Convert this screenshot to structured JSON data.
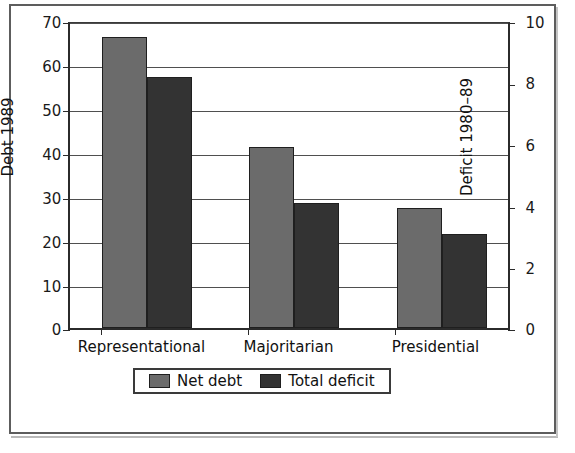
{
  "chart_data": {
    "type": "bar",
    "title": "",
    "subtitle": "",
    "categories": [
      "Representational",
      "Majoritarian",
      "Presidential"
    ],
    "series": [
      {
        "name": "Net debt",
        "axis": "left",
        "color": "#6b6b6b",
        "values": [
          66.2,
          41.2,
          27.2
        ]
      },
      {
        "name": "Total deficit",
        "axis": "right",
        "color": "#333333",
        "values": [
          8.15,
          4.05,
          3.05
        ]
      }
    ],
    "left_axis": {
      "label": "Debt 1989",
      "ticks": [
        0,
        10,
        20,
        30,
        40,
        50,
        60,
        70
      ],
      "lim": [
        0,
        70
      ]
    },
    "right_axis": {
      "label": "Deficit 1980–89",
      "ticks": [
        0,
        2,
        4,
        6,
        8,
        10
      ],
      "lim": [
        0,
        10
      ]
    },
    "xlabel": "",
    "grid": true,
    "legend_position": "bottom-center",
    "legend_entries": [
      "Net debt",
      "Total deficit"
    ],
    "bar_values_left_scale": {
      "net_debt": [
        66.2,
        41.2,
        27.2
      ],
      "total_deficit": [
        57.0,
        28.4,
        21.4
      ]
    }
  },
  "colors": {
    "net_debt": "#6b6b6b",
    "total_deficit": "#333333",
    "axis": "#2b2b2b",
    "grid": "#4f4f4f",
    "frame": "#5d5d5d",
    "background": "#ffffff",
    "text": "#111111"
  }
}
